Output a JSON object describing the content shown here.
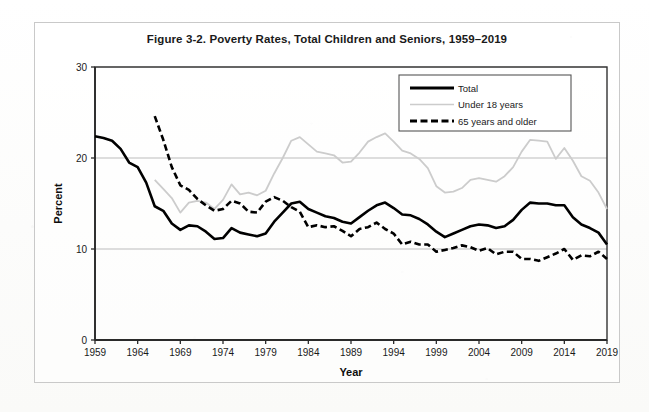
{
  "figure": {
    "title": "Figure 3-2. Poverty Rates, Total Children and Seniors, 1959–2019"
  },
  "chart_data": {
    "type": "line",
    "title": "Figure 3-2. Poverty Rates, Total Children and Seniors, 1959–2019",
    "xlabel": "Year",
    "ylabel": "Percent",
    "xlim": [
      1959,
      2019
    ],
    "ylim": [
      0,
      30
    ],
    "yticks": [
      0,
      10,
      20,
      30
    ],
    "ytick_labels": [
      "0",
      "10",
      "20",
      "30"
    ],
    "xticks": [
      1959,
      1964,
      1969,
      1974,
      1979,
      1984,
      1989,
      1994,
      1999,
      2004,
      2009,
      2014,
      2019
    ],
    "xtick_labels": [
      "1959",
      "1964",
      "1969",
      "1974",
      "1979",
      "1984",
      "1989",
      "1994",
      "1999",
      "2004",
      "2009",
      "2014",
      "2019"
    ],
    "grid": "horizontal-only",
    "legend_position": "upper-right-inside",
    "series": [
      {
        "name": "Total",
        "style": "solid",
        "color": "#000000",
        "width": 2.6,
        "x": [
          1959,
          1960,
          1961,
          1962,
          1963,
          1964,
          1965,
          1966,
          1967,
          1968,
          1969,
          1970,
          1971,
          1972,
          1973,
          1974,
          1975,
          1976,
          1977,
          1978,
          1979,
          1980,
          1981,
          1982,
          1983,
          1984,
          1985,
          1986,
          1987,
          1988,
          1989,
          1990,
          1991,
          1992,
          1993,
          1994,
          1995,
          1996,
          1997,
          1998,
          1999,
          2000,
          2001,
          2002,
          2003,
          2004,
          2005,
          2006,
          2007,
          2008,
          2009,
          2010,
          2011,
          2012,
          2013,
          2014,
          2015,
          2016,
          2017,
          2018,
          2019
        ],
        "y": [
          22.4,
          22.2,
          21.9,
          21.0,
          19.5,
          19.0,
          17.3,
          14.7,
          14.2,
          12.8,
          12.1,
          12.6,
          12.5,
          11.9,
          11.1,
          11.2,
          12.3,
          11.8,
          11.6,
          11.4,
          11.7,
          13.0,
          14.0,
          15.0,
          15.2,
          14.4,
          14.0,
          13.6,
          13.4,
          13.0,
          12.8,
          13.5,
          14.2,
          14.8,
          15.1,
          14.5,
          13.8,
          13.7,
          13.3,
          12.7,
          11.9,
          11.3,
          11.7,
          12.1,
          12.5,
          12.7,
          12.6,
          12.3,
          12.5,
          13.2,
          14.3,
          15.1,
          15.0,
          15.0,
          14.8,
          14.8,
          13.5,
          12.7,
          12.3,
          11.8,
          10.5
        ]
      },
      {
        "name": "Under 18 years",
        "style": "solid",
        "color": "#cccccc",
        "width": 1.8,
        "x": [
          1966,
          1967,
          1968,
          1969,
          1970,
          1971,
          1972,
          1973,
          1974,
          1975,
          1976,
          1977,
          1978,
          1979,
          1980,
          1981,
          1982,
          1983,
          1984,
          1985,
          1986,
          1987,
          1988,
          1989,
          1990,
          1991,
          1992,
          1993,
          1994,
          1995,
          1996,
          1997,
          1998,
          1999,
          2000,
          2001,
          2002,
          2003,
          2004,
          2005,
          2006,
          2007,
          2008,
          2009,
          2010,
          2011,
          2012,
          2013,
          2014,
          2015,
          2016,
          2017,
          2018,
          2019
        ],
        "y": [
          17.6,
          16.6,
          15.6,
          14.0,
          15.1,
          15.3,
          15.1,
          14.4,
          15.4,
          17.1,
          16.0,
          16.2,
          15.9,
          16.4,
          18.3,
          20.0,
          21.9,
          22.3,
          21.5,
          20.7,
          20.5,
          20.3,
          19.5,
          19.6,
          20.6,
          21.8,
          22.3,
          22.7,
          21.8,
          20.8,
          20.5,
          19.9,
          18.9,
          16.9,
          16.2,
          16.3,
          16.7,
          17.6,
          17.8,
          17.6,
          17.4,
          18.0,
          19.0,
          20.7,
          22.0,
          21.9,
          21.8,
          19.9,
          21.1,
          19.7,
          18.0,
          17.5,
          16.2,
          14.4
        ]
      },
      {
        "name": "65 years and older",
        "style": "dashed",
        "color": "#000000",
        "width": 2.6,
        "x": [
          1966,
          1967,
          1968,
          1969,
          1970,
          1971,
          1972,
          1973,
          1974,
          1975,
          1976,
          1977,
          1978,
          1979,
          1980,
          1981,
          1982,
          1983,
          1984,
          1985,
          1986,
          1987,
          1988,
          1989,
          1990,
          1991,
          1992,
          1993,
          1994,
          1995,
          1996,
          1997,
          1998,
          1999,
          2000,
          2001,
          2002,
          2003,
          2004,
          2005,
          2006,
          2007,
          2008,
          2009,
          2010,
          2011,
          2012,
          2013,
          2014,
          2015,
          2016,
          2017,
          2018,
          2019
        ],
        "y": [
          24.6,
          22.0,
          19.0,
          17.0,
          16.5,
          15.5,
          14.8,
          14.2,
          14.4,
          15.3,
          15.0,
          14.1,
          14.0,
          15.2,
          15.7,
          15.3,
          14.6,
          14.1,
          12.4,
          12.6,
          12.4,
          12.5,
          12.0,
          11.4,
          12.2,
          12.4,
          12.9,
          12.2,
          11.7,
          10.5,
          10.8,
          10.5,
          10.5,
          9.7,
          9.9,
          10.1,
          10.4,
          10.2,
          9.8,
          10.1,
          9.4,
          9.7,
          9.7,
          8.9,
          8.9,
          8.7,
          9.1,
          9.5,
          10.0,
          8.8,
          9.3,
          9.2,
          9.7,
          8.9
        ]
      }
    ],
    "legend": [
      {
        "label": "Total",
        "style": "solid-thick",
        "color": "#000000"
      },
      {
        "label": "Under 18 years",
        "style": "solid-thin",
        "color": "#cccccc"
      },
      {
        "label": "65 years and older",
        "style": "dashed-thick",
        "color": "#000000"
      }
    ]
  }
}
